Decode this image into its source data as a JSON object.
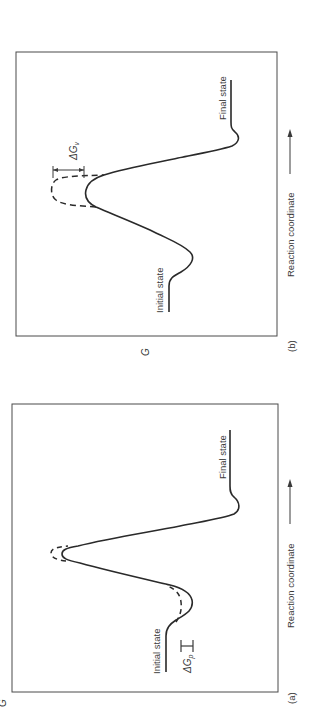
{
  "figure": {
    "orientation": "rotated-90-ccw",
    "colors": {
      "ink": "#2a2a2a",
      "frame": "#4a4a4a",
      "background": "#ffffff"
    },
    "panels": [
      {
        "id": "b",
        "caption": "(b)",
        "y_axis_label": "G",
        "x_axis_label": "Reaction coordinate",
        "x_axis_arrow": "→",
        "initial_state_label": "Initial state",
        "final_state_label": "Final state",
        "delta_label": "ΔG",
        "delta_subscript": "v",
        "description": "Solid curve lowered at the transition-state peak relative to dashed curve"
      },
      {
        "id": "a",
        "caption": "(a)",
        "y_axis_label": "G",
        "x_axis_label": "Reaction coordinate",
        "x_axis_arrow": "→",
        "initial_state_label": "Initial state",
        "final_state_label": "Final state",
        "delta_label": "ΔG",
        "delta_subscript": "p",
        "description": "Solid curve lowered at the initial-state well relative to dashed curve"
      }
    ]
  }
}
